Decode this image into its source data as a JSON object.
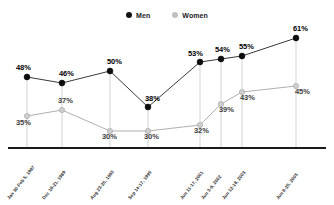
{
  "chart_data": {
    "type": "line",
    "title": "",
    "xlabel": "",
    "ylabel": "",
    "ylim": [
      0,
      70
    ],
    "grid": false,
    "legend_position": "top-center",
    "categories": [
      "Jan 30-Feb 5, 1987",
      "Dec 18-21, 1989",
      "Aug 23-25, 1993",
      "Sep 14-17, 1995",
      "Jun 11-17, 2001",
      "Jun 3-9, 2002",
      "Jun 12-18, 2003",
      "Jun 6-25, 2005"
    ],
    "series": [
      {
        "name": "Men",
        "color": "#111111",
        "values": [
          48,
          46,
          50,
          38,
          53,
          54,
          55,
          61
        ],
        "labels": [
          "48%",
          "46%",
          "50%",
          "38%",
          "53%",
          "54%",
          "55%",
          "61%"
        ]
      },
      {
        "name": "Women",
        "color": "#b5b5b5",
        "values": [
          35,
          37,
          30,
          30,
          32,
          39,
          43,
          45
        ],
        "labels": [
          "35%",
          "37%",
          "30%",
          "30%",
          "32%",
          "39%",
          "43%",
          "45%"
        ]
      }
    ]
  },
  "legend": {
    "items": [
      {
        "label": "Men",
        "color": "#111111"
      },
      {
        "label": "Women",
        "color": "#c0c0c0"
      }
    ]
  },
  "axis": {
    "baseline_color": "#1a1a1a",
    "dropline_color": "#c8c8c8"
  },
  "top_fragment": ""
}
